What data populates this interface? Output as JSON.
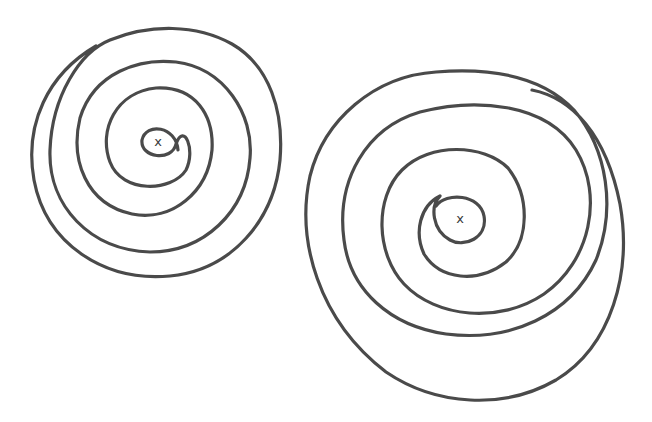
{
  "figure": {
    "stroke_color": "#4a4a4a",
    "background": "#ffffff",
    "spirals": [
      {
        "name": "left-spiral",
        "center_x": 158,
        "center_y": 141,
        "center_mark": "x",
        "turns": 4,
        "direction": "counterclockwise-outward",
        "outer_radius": 128
      },
      {
        "name": "right-spiral",
        "center_x": 460,
        "center_y": 218,
        "center_mark": "x",
        "turns": 4,
        "direction": "clockwise-outward",
        "outer_radius": 165
      }
    ]
  }
}
